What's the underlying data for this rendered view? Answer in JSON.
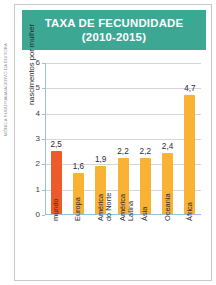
{
  "credit": "MÔNICA SUGUIYAMA/ACERVO DA EDITORA",
  "header": {
    "line1": "TAXA DE FECUNDIDADE",
    "line2": "(2010-2015)"
  },
  "colors": {
    "header_bg": "#3ca894",
    "highlight_bar": "#ee5b2b",
    "bar": "#f9b233",
    "grid": "#d6d6d6",
    "axis": "#9bbfd6",
    "border": "#c9c9c9"
  },
  "chart_data": {
    "type": "bar",
    "title": "TAXA DE FECUNDIDADE (2010-2015)",
    "xlabel": "",
    "ylabel": "nascimentos por mulher",
    "ylim": [
      0,
      6
    ],
    "yticks": [
      0,
      1,
      2,
      3,
      4,
      5,
      6
    ],
    "ytick_labels": [
      "0",
      "1",
      "2",
      "3",
      "4",
      "5",
      "6"
    ],
    "grid": true,
    "legend": false,
    "categories": [
      "mundo",
      "Europa",
      "América do Norte",
      "América Latina",
      "Ásia",
      "Oceania",
      "África"
    ],
    "category_lines": [
      [
        "mundo"
      ],
      [
        "Europa"
      ],
      [
        "América",
        "do Norte"
      ],
      [
        "América",
        "Latina"
      ],
      [
        "Ásia"
      ],
      [
        "Oceania"
      ],
      [
        "África"
      ]
    ],
    "values": [
      2.5,
      1.6,
      1.9,
      2.2,
      2.2,
      2.4,
      4.7
    ],
    "value_labels": [
      "2,5",
      "1,6",
      "1,9",
      "2,2",
      "2,2",
      "2,4",
      "4,7"
    ],
    "bar_colors": [
      "#ee5b2b",
      "#f9b233",
      "#f9b233",
      "#f9b233",
      "#f9b233",
      "#f9b233",
      "#f9b233"
    ]
  }
}
